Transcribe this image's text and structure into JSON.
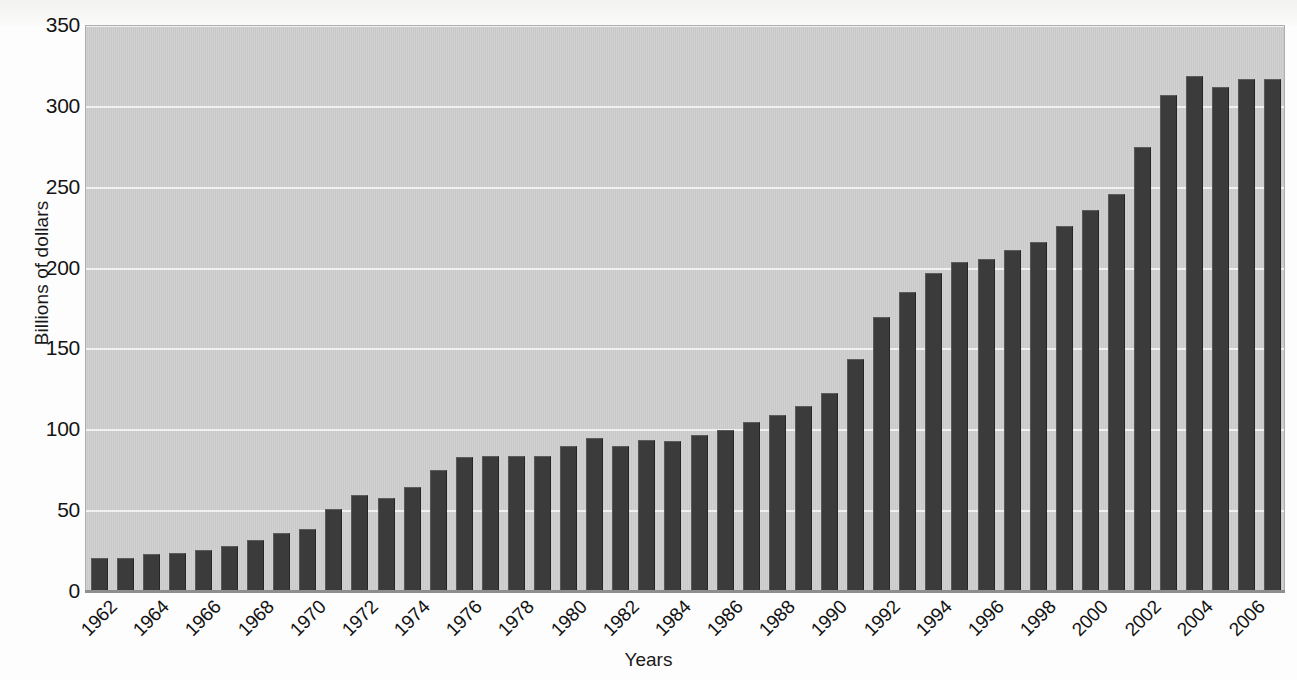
{
  "chart_data": {
    "type": "bar",
    "title": "",
    "subtitle": "",
    "xlabel": "Years",
    "ylabel": "Billions of dollars",
    "ylim": [
      0,
      350
    ],
    "yticks": [
      0,
      50,
      100,
      150,
      200,
      250,
      300,
      350
    ],
    "ytick_labels": [
      "0",
      "50",
      "100",
      "150",
      "200",
      "250",
      "300",
      "350"
    ],
    "grid": true,
    "legend": "none",
    "xtick_step": 2,
    "xtick_labels": [
      "1962",
      "1964",
      "1966",
      "1968",
      "1970",
      "1972",
      "1974",
      "1976",
      "1978",
      "1980",
      "1982",
      "1984",
      "1986",
      "1988",
      "1990",
      "1992",
      "1994",
      "1996",
      "1998",
      "2000",
      "2002",
      "2004",
      "2006"
    ],
    "bar_color": "#3b3b3b",
    "plot_background": "#c9c9c9",
    "gridline_color": "#f1f1f1",
    "categories": [
      "1962",
      "1963",
      "1964",
      "1965",
      "1966",
      "1967",
      "1968",
      "1969",
      "1970",
      "1971",
      "1972",
      "1973",
      "1974",
      "1975",
      "1976",
      "1977",
      "1978",
      "1979",
      "1980",
      "1981",
      "1982",
      "1983",
      "1984",
      "1985",
      "1986",
      "1987",
      "1988",
      "1989",
      "1990",
      "1991",
      "1992",
      "1993",
      "1994",
      "1995",
      "1996",
      "1997",
      "1998",
      "1999",
      "2000",
      "2001",
      "2002",
      "2003",
      "2004",
      "2005",
      "2006",
      "2007"
    ],
    "values": [
      20,
      20,
      22,
      23,
      25,
      27,
      31,
      35,
      38,
      50,
      59,
      57,
      64,
      74,
      82,
      83,
      83,
      83,
      89,
      94,
      89,
      93,
      92,
      96,
      99,
      104,
      108,
      114,
      122,
      143,
      169,
      184,
      196,
      203,
      205,
      210,
      215,
      225,
      235,
      245,
      274,
      306,
      318,
      311,
      316,
      316
    ]
  }
}
